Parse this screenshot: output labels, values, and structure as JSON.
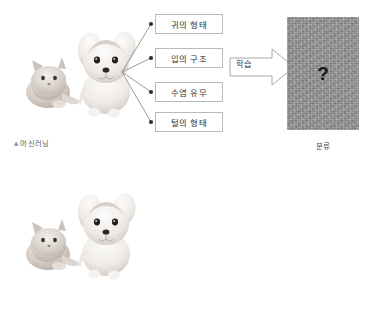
{
  "diagram": {
    "sections": [
      {
        "id": "machine-learning",
        "caption": "머신러닝",
        "caption_marker": "▲",
        "photo_alt": "cat-and-dog-photo",
        "features": [
          {
            "label": "귀의 형태"
          },
          {
            "label": "입의 구조"
          },
          {
            "label": "수염 유무"
          },
          {
            "label": "털의 형태"
          }
        ],
        "arrow_label": "학습",
        "result": {
          "symbol": "?",
          "caption": "분류"
        }
      },
      {
        "id": "deep-learning",
        "caption": "딥러닝",
        "caption_marker": "▲",
        "photo_alt": "cat-and-dog-photo",
        "features": [],
        "arrow_label": "학습",
        "result": {
          "symbol": "?",
          "caption": "분류"
        }
      }
    ]
  },
  "colors": {
    "box_border": "#b9b9b9",
    "arrow_stroke": "#a8a8a8",
    "line_stroke": "#8f8f8f",
    "dot_fill": "#2e2e2e",
    "gray_panel": "#9a9a9a",
    "text": "#2f2f2f",
    "caption_text": "#5a5a5a"
  }
}
